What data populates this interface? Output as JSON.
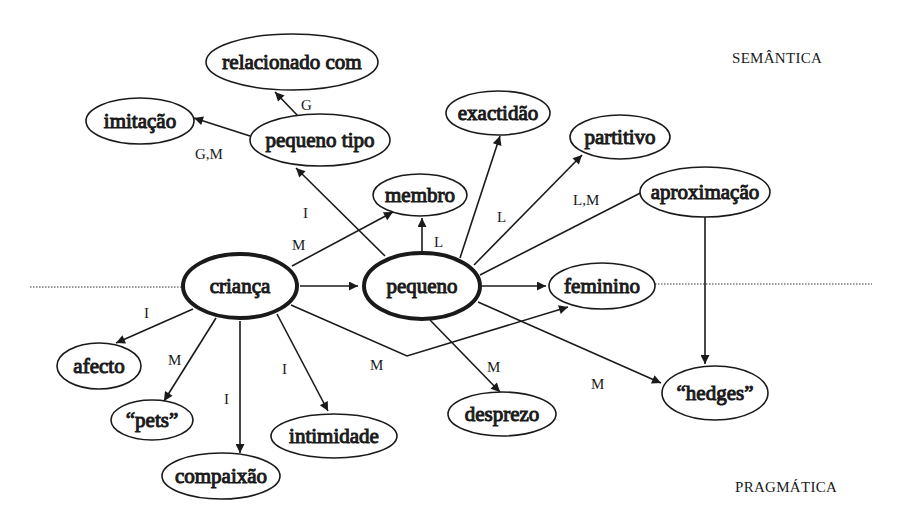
{
  "regions": {
    "top": "SEMÂNTICA",
    "bottom": "PRAGMÁTICA"
  },
  "nodes": {
    "crianca": "criança",
    "pequeno": "pequeno",
    "membro": "membro",
    "pequeno_tipo": "pequeno tipo",
    "relacionado_com": "relacionado com",
    "imitacao": "imitação",
    "exactidao": "exactidão",
    "partitivo": "partitivo",
    "aproximacao": "aproximação",
    "feminino": "feminino",
    "hedges": "“hedges”",
    "desprezo": "desprezo",
    "afecto": "afecto",
    "pets": "“pets”",
    "compaixao": "compaixão",
    "intimidade": "intimidade"
  },
  "edge_labels": {
    "pequeno_tipo_relacionado": "G",
    "pequeno_tipo_imitacao": "G,M",
    "pequeno_pequeno_tipo": "I",
    "crianca_membro": "M",
    "pequeno_membro": "L",
    "pequeno_partitivo": "L",
    "pequeno_aproximacao": "L,M",
    "crianca_afecto": "I",
    "crianca_pets": "M",
    "crianca_compaixao": "I",
    "crianca_intimidade": "I",
    "crianca_feminino": "M",
    "pequeno_desprezo": "M",
    "pequeno_hedges": "M"
  },
  "edges": [
    {
      "from": "criança",
      "to": "pequeno",
      "label": ""
    },
    {
      "from": "criança",
      "to": "membro",
      "label": "M"
    },
    {
      "from": "criança",
      "to": "afecto",
      "label": "I"
    },
    {
      "from": "criança",
      "to": "“pets”",
      "label": "M"
    },
    {
      "from": "criança",
      "to": "compaixão",
      "label": "I"
    },
    {
      "from": "criança",
      "to": "intimidade",
      "label": "I"
    },
    {
      "from": "criança",
      "to": "feminino",
      "label": "M"
    },
    {
      "from": "pequeno",
      "to": "pequeno tipo",
      "label": "I"
    },
    {
      "from": "pequeno",
      "to": "membro",
      "label": "L"
    },
    {
      "from": "pequeno",
      "to": "exactidão",
      "label": ""
    },
    {
      "from": "pequeno",
      "to": "partitivo",
      "label": "L"
    },
    {
      "from": "pequeno",
      "to": "aproximação",
      "label": "L,M"
    },
    {
      "from": "pequeno",
      "to": "feminino",
      "label": ""
    },
    {
      "from": "pequeno",
      "to": "desprezo",
      "label": "M"
    },
    {
      "from": "pequeno",
      "to": "“hedges”",
      "label": "M"
    },
    {
      "from": "pequeno tipo",
      "to": "relacionado com",
      "label": "G"
    },
    {
      "from": "pequeno tipo",
      "to": "imitação",
      "label": "G,M"
    },
    {
      "from": "aproximação",
      "to": "“hedges”",
      "label": ""
    }
  ],
  "colors": {
    "ink": "#1a1a1a",
    "background": "#ffffff"
  }
}
